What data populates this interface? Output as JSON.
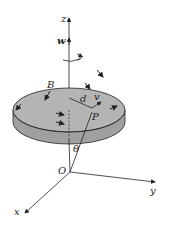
{
  "diagram": {
    "labels": {
      "z": "z",
      "w": "w",
      "B": "B",
      "d": "d",
      "v": "v",
      "P": "P",
      "theta": "θ",
      "O": "O",
      "x": "x",
      "y": "y"
    },
    "colors": {
      "disk_top": "#b4b4b4",
      "disk_side": "#a0a0a0",
      "stroke": "#222222"
    }
  }
}
